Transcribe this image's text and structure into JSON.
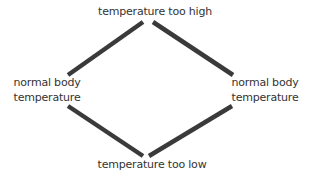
{
  "diagram": {
    "title": "",
    "nodes": {
      "top": {
        "label": "temperature too high"
      },
      "left": {
        "line1": "normal body",
        "line2": "temperature"
      },
      "right": {
        "line1": "normal body",
        "line2": "temperature"
      },
      "bottom": {
        "label": "temperature too low"
      }
    },
    "edges": [
      {
        "from": "left",
        "to": "top"
      },
      {
        "from": "top",
        "to": "right"
      },
      {
        "from": "left",
        "to": "bottom"
      },
      {
        "from": "bottom",
        "to": "right"
      }
    ],
    "colors": {
      "line": "#3a3a3a",
      "text": "#333333",
      "background": "#ffffff"
    }
  }
}
